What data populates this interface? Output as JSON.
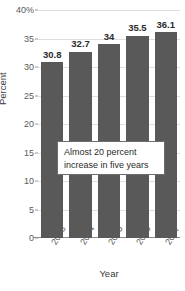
{
  "chart_data": {
    "type": "bar",
    "title": "",
    "subtitle": "",
    "xlabel": "Year",
    "ylabel": "Percent",
    "categories": [
      "2003",
      "2004",
      "2005",
      "2006",
      "2007"
    ],
    "values": [
      30.8,
      32.7,
      34,
      35.5,
      36.1
    ],
    "data_labels": [
      "30.8",
      "32.7",
      "34",
      "35.5",
      "36.1"
    ],
    "series": [
      {
        "name": "Percent",
        "values": [
          30.8,
          32.7,
          34,
          35.5,
          36.1
        ]
      }
    ],
    "ylim": [
      0,
      40
    ],
    "ytick_values": [
      0,
      5,
      10,
      15,
      20,
      25,
      30,
      35,
      40
    ],
    "ytick_labels": [
      "0",
      "5",
      "10",
      "15",
      "20",
      "25",
      "30",
      "35",
      "40%"
    ],
    "grid": true,
    "legend": false,
    "legend_position": "none",
    "bar_color": "#595959",
    "gridline_color": "#dedede",
    "axis_color": "#8c8c8c",
    "background_color": "#ffffff",
    "annotations": [
      {
        "name": "callout",
        "lines": [
          "Almost 20 percent",
          "increase in five years"
        ]
      }
    ]
  },
  "annotation": {
    "line1": "Almost 20 percent",
    "line2": "increase in five years"
  }
}
